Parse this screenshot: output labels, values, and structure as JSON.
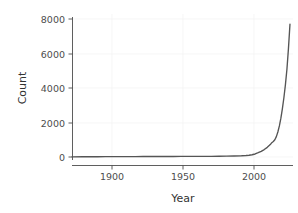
{
  "chart_data": {
    "type": "line",
    "title": "",
    "xlabel": "Year",
    "ylabel": "Count",
    "xlim": [
      1878,
      2024
    ],
    "ylim": [
      -250,
      8400
    ],
    "xticks": [
      1900,
      1950,
      2000
    ],
    "xtick_labels": [
      "1900",
      "1950",
      "2000"
    ],
    "yticks": [
      0,
      2000,
      4000,
      6000,
      8000
    ],
    "ytick_labels": [
      "0",
      "2000",
      "4000",
      "6000",
      "8000"
    ],
    "grid": "faint",
    "legend": "none",
    "line_color": "#555555",
    "series": [
      {
        "name": "Count",
        "x": [
          1878,
          1885,
          1890,
          1895,
          1900,
          1905,
          1910,
          1915,
          1920,
          1925,
          1930,
          1935,
          1940,
          1945,
          1950,
          1955,
          1960,
          1965,
          1970,
          1975,
          1980,
          1985,
          1990,
          1993,
          1995,
          1997,
          1999,
          2001,
          2003,
          2005,
          2007,
          2009,
          2010,
          2011,
          2012,
          2013,
          2014,
          2015,
          2016,
          2017,
          2018,
          2019,
          2020,
          2021,
          2022
        ],
        "y": [
          10,
          12,
          14,
          16,
          18,
          20,
          22,
          24,
          26,
          28,
          30,
          30,
          30,
          30,
          32,
          34,
          36,
          38,
          40,
          44,
          50,
          58,
          70,
          85,
          100,
          130,
          175,
          250,
          330,
          430,
          560,
          720,
          830,
          900,
          1000,
          1180,
          1450,
          1800,
          2250,
          2800,
          3450,
          4200,
          5100,
          6300,
          7700
        ]
      }
    ],
    "peak_value": 7700,
    "peak_year": 2022
  },
  "axis": {
    "y_title": "Count",
    "x_title": "Year"
  }
}
